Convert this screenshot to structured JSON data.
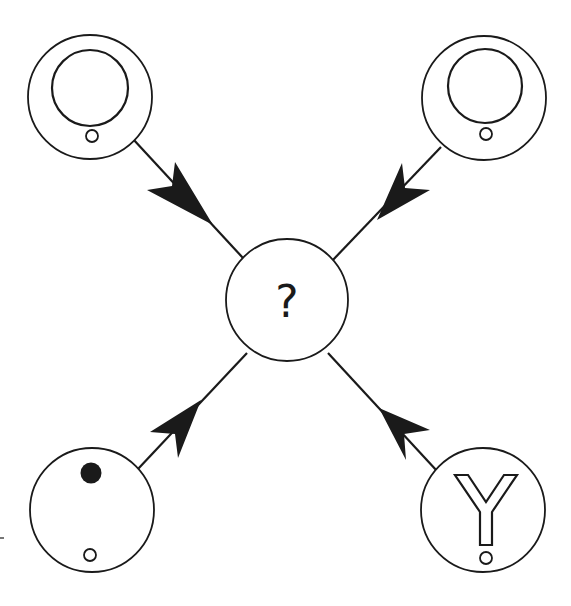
{
  "diagram": {
    "type": "radial-node-diagram",
    "center_node": {
      "id": "center",
      "label": "?",
      "cx": 287,
      "cy": 300,
      "r": 61
    },
    "nodes": [
      {
        "id": "top-left",
        "symbol": "ring-with-small-circle",
        "cx": 90,
        "cy": 95,
        "r": 62
      },
      {
        "id": "top-right",
        "symbol": "ring-with-small-circle",
        "cx": 484,
        "cy": 98,
        "r": 62
      },
      {
        "id": "bottom-left",
        "symbol": "filled-dot-and-small-circle",
        "cx": 90,
        "cy": 510,
        "r": 62
      },
      {
        "id": "bottom-right",
        "symbol": "outlined-Y-with-small-circle",
        "cx": 483,
        "cy": 510,
        "r": 62
      }
    ],
    "edges": [
      {
        "from": "top-left",
        "to": "center",
        "arrow_direction": "toward-center"
      },
      {
        "from": "top-right",
        "to": "center",
        "arrow_direction": "toward-center"
      },
      {
        "from": "center",
        "to": "bottom-left",
        "arrow_direction": "away-from-center"
      },
      {
        "from": "center",
        "to": "bottom-right",
        "arrow_direction": "away-from-center"
      }
    ],
    "colors": {
      "stroke": "#1a1a1a",
      "background": "#ffffff"
    }
  }
}
